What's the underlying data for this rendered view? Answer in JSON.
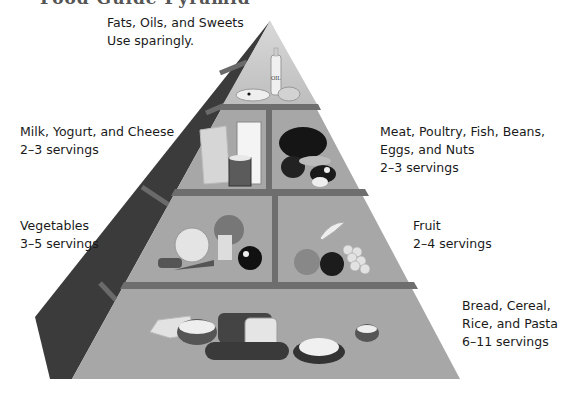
{
  "title": "Food Guide Pyramid",
  "groups": [
    {
      "name": "Fats, Oils, and Sweets",
      "servings": "Use sparingly.",
      "icons": [
        "oil-bottle-icon",
        "cake-slice-icon",
        "candy-icon"
      ]
    },
    {
      "name": "Milk, Yogurt, and Cheese",
      "servings": "2–3 servings",
      "icons": [
        "milk-glass-icon",
        "yogurt-cup-icon",
        "cheese-icon"
      ]
    },
    {
      "name_line1": "Meat, Poultry, Fish, Beans,",
      "name_line2": "Eggs, and Nuts",
      "servings": "2–3 servings",
      "icons": [
        "chicken-icon",
        "fish-icon",
        "egg-icon",
        "beans-icon"
      ]
    },
    {
      "name": "Vegetables",
      "servings": "3–5 servings",
      "icons": [
        "lettuce-icon",
        "broccoli-icon",
        "carrot-icon",
        "tomato-icon"
      ]
    },
    {
      "name": "Fruit",
      "servings": "2–4 servings",
      "icons": [
        "banana-icon",
        "apple-icon",
        "orange-icon",
        "grapes-icon"
      ]
    },
    {
      "name_line1": "Bread, Cereal,",
      "name_line2": "Rice, and Pasta",
      "servings": "6–11 servings",
      "icons": [
        "bread-icon",
        "cereal-bowl-icon",
        "pasta-plate-icon",
        "rice-bowl-icon"
      ]
    }
  ],
  "oil_label": "OIL",
  "colors": {
    "front_face": "#a9a9a9",
    "front_top": "#c4c4c4",
    "side_face": "#3d3d3d",
    "shelf": "#6e6e6e"
  }
}
